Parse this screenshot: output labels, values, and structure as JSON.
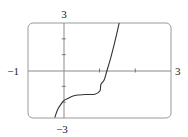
{
  "chart_data": {
    "type": "line",
    "title": "",
    "xlabel": "",
    "ylabel": "",
    "xlim": [
      -1,
      3
    ],
    "ylim": [
      -3,
      3
    ],
    "grid": false,
    "legend": null,
    "tick_labels": {
      "x_min": "−1",
      "x_max": "3",
      "y_max": "3",
      "y_min": "−3"
    },
    "x_ticks": [
      1,
      2
    ],
    "y_ticks": [
      -2,
      -1,
      1,
      2
    ],
    "series": [
      {
        "name": "f(x)",
        "color": "#333333",
        "x": [
          -0.25,
          -0.17,
          -0.06,
          0.0,
          0.11,
          0.31,
          0.59,
          0.87,
          1.01,
          1.04,
          1.13,
          1.21,
          1.32,
          1.41,
          1.48,
          1.55
        ],
        "y": [
          -2.97,
          -2.46,
          -2.08,
          -1.9,
          -1.77,
          -1.58,
          -1.52,
          -1.5,
          -1.3,
          -0.88,
          -0.6,
          0.0,
          0.85,
          1.64,
          2.3,
          3.0
        ]
      }
    ]
  }
}
